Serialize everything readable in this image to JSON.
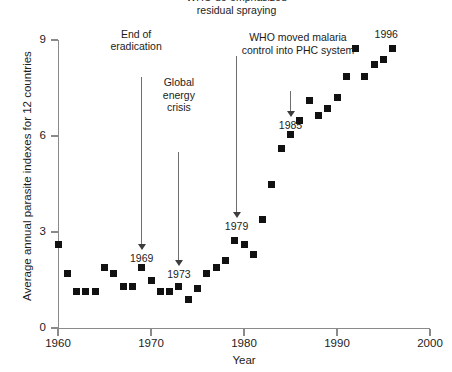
{
  "chart_data": {
    "type": "scatter",
    "title": "",
    "xlabel": "Year",
    "ylabel": "Average annual parasite indexes for 12 countries",
    "xlim": [
      1960,
      2000
    ],
    "ylim": [
      0,
      9
    ],
    "xticks": [
      1960,
      1970,
      1980,
      1990,
      2000
    ],
    "yticks": [
      0,
      3,
      6,
      9
    ],
    "xtick_labels": [
      "1960",
      "1970",
      "1980",
      "1990",
      "2000"
    ],
    "ytick_labels": [
      "0",
      "3",
      "6",
      "9"
    ],
    "grid": false,
    "legend": null,
    "marker": "square",
    "marker_color": "#111111",
    "series": [
      {
        "name": "Average annual parasite index",
        "x": [
          1960,
          1961,
          1962,
          1963,
          1964,
          1965,
          1966,
          1967,
          1968,
          1969,
          1970,
          1971,
          1972,
          1973,
          1974,
          1975,
          1976,
          1977,
          1978,
          1979,
          1980,
          1981,
          1982,
          1983,
          1984,
          1985,
          1986,
          1987,
          1988,
          1989,
          1990,
          1991,
          1992,
          1993,
          1994,
          1995,
          1996
        ],
        "y": [
          2.6,
          1.7,
          1.15,
          1.15,
          1.15,
          1.9,
          1.7,
          1.3,
          1.3,
          1.9,
          1.5,
          1.15,
          1.15,
          1.3,
          0.9,
          1.25,
          1.7,
          1.9,
          2.1,
          2.75,
          2.6,
          2.3,
          3.4,
          4.5,
          5.6,
          6.05,
          6.5,
          7.1,
          6.65,
          6.85,
          7.2,
          7.85,
          8.75,
          7.85,
          8.25,
          8.4,
          8.75
        ]
      }
    ],
    "annotations": [
      {
        "id": "end-of-eradication",
        "text": "End of\neradication",
        "text_x": 1968.4,
        "text_y": 8.6,
        "arrow_from_y": 7.85,
        "arrow_to_x": 1969,
        "arrow_to_y": 2.45,
        "point_label": "1969"
      },
      {
        "id": "global-energy-crisis",
        "text": "Global\nenergy\ncrisis",
        "text_x": 1973,
        "text_y": 6.7,
        "arrow_from_y": 5.5,
        "arrow_to_x": 1973,
        "arrow_to_y": 1.95,
        "point_label": "1973"
      },
      {
        "id": "who-de-emphasized-residual-spraying",
        "text": "WHO de-emphasized\nresidual spraying",
        "text_x": 1979.2,
        "text_y": 9.75,
        "arrow_from_y": 8.5,
        "arrow_to_x": 1979.2,
        "arrow_to_y": 3.45,
        "point_label": "1979"
      },
      {
        "id": "who-moved-malaria-control-into-phc-system",
        "text": "WHO moved malaria\ncontrol into PHC system",
        "text_x": 1985.8,
        "text_y": 8.5,
        "arrow_from_y": 7.4,
        "arrow_to_x": 1985,
        "arrow_to_y": 6.6,
        "point_label": "1985"
      }
    ],
    "data_labels": [
      {
        "id": "label-1996",
        "text": "1996",
        "x": 1995.3,
        "y": 9.2
      }
    ]
  },
  "axis": {
    "y_title": "Average annual parasite indexes for 12 countries",
    "x_title": "Year"
  }
}
